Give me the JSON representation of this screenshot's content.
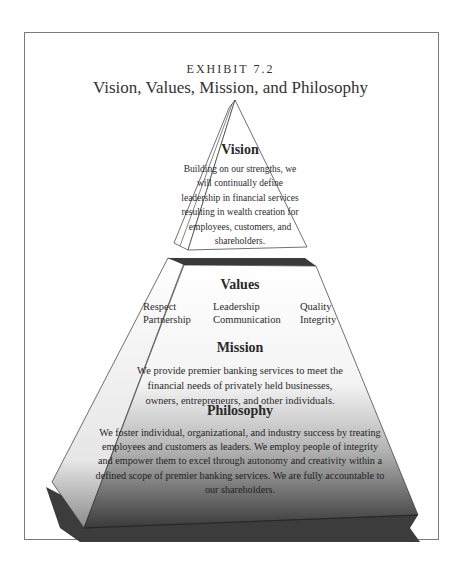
{
  "exhibit_label": "EXHIBIT 7.2",
  "title": "Vision, Values, Mission, and Philosophy",
  "vision": {
    "heading": "Vision",
    "text": "Building on our strengths, we will continually define leadership in financial services resulting in wealth creation for employees, customers, and shareholders."
  },
  "values": {
    "heading": "Values",
    "items": [
      "Respect",
      "Partnership",
      "Leadership",
      "Communication",
      "Quality",
      "Integrity"
    ]
  },
  "mission": {
    "heading": "Mission",
    "text": "We provide premier banking services to meet the financial needs of privately held businesses, owners, entrepreneurs, and other individuals."
  },
  "philosophy": {
    "heading": "Philosophy",
    "text": "We foster individual, organizational, and industry success by treating employees and customers as leaders. We employ people of integrity and empower them to excel through autonomy and creativity within a defined scope of premier banking services. We are fully accountable to our shareholders."
  },
  "colors": {
    "frame": "#7a7a7a",
    "shadow": "#3c3c3c",
    "gradient_top": "#ffffff",
    "gradient_bottom": "#3a3a3a"
  }
}
